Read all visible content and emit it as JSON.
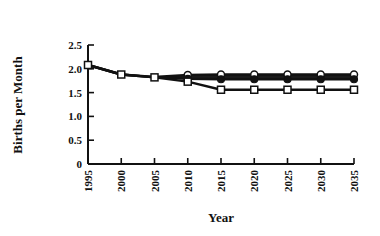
{
  "chart_data": {
    "type": "line",
    "title": "",
    "xlabel": "Year",
    "ylabel": "Births per Month",
    "x": [
      1995,
      2000,
      2005,
      2010,
      2015,
      2020,
      2025,
      2030,
      2035
    ],
    "xticks": [
      "1995",
      "2000",
      "2005",
      "2010",
      "2015",
      "2020",
      "2025",
      "2030",
      "2035"
    ],
    "yticks": [
      "0",
      "0.5",
      "1.0",
      "1.5",
      "2.0",
      "2.5"
    ],
    "ylim": [
      0,
      2.5
    ],
    "xlim": [
      1995,
      2035
    ],
    "grid": false,
    "legend": null,
    "series": [
      {
        "name": "High (open circles)",
        "marker": "circle-open",
        "values": [
          2.08,
          1.88,
          1.83,
          1.87,
          1.88,
          1.88,
          1.88,
          1.88,
          1.88
        ]
      },
      {
        "name": "Middle (filled circles)",
        "marker": "circle-filled",
        "values": [
          2.08,
          1.88,
          1.82,
          1.79,
          1.78,
          1.78,
          1.78,
          1.78,
          1.78
        ]
      },
      {
        "name": "Low (open squares)",
        "marker": "square-open",
        "values": [
          2.08,
          1.88,
          1.82,
          1.73,
          1.56,
          1.56,
          1.56,
          1.56,
          1.56
        ]
      }
    ]
  }
}
